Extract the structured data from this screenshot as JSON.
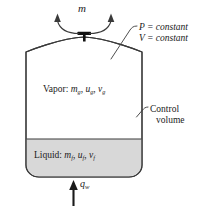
{
  "figure": {
    "colors": {
      "stroke": "#3a3a3a",
      "liquid_fill": "#d8d8d8",
      "vapor_fill": "#ffffff",
      "text": "#1a1a1a",
      "valve": "#111111"
    }
  },
  "labels": {
    "mass_flow": {
      "symbol": "m",
      "accent": "dot",
      "name": "mass flow rate out"
    },
    "pressure_constant": "P = constant",
    "volume_constant": "V = constant",
    "vapor": {
      "prefix": "Vapor:",
      "mass": "m",
      "internal_energy": "u",
      "specific_volume": "v",
      "subscript": "g"
    },
    "liquid": {
      "prefix": "Liquid:",
      "mass": "m",
      "internal_energy": "u",
      "specific_volume": "v",
      "subscript": "f"
    },
    "control_volume_line1": "Control",
    "control_volume_line2": "volume",
    "heat_flux": {
      "symbol": "q",
      "subscript": "w",
      "name": "wall heat flux in"
    }
  },
  "icons": {
    "valve": "valve-icon",
    "outflow_arrow_left": "curved-arrow-up-left-icon",
    "outflow_arrow_right": "curved-arrow-up-right-icon",
    "heat_arrow": "arrow-up-icon",
    "leader_pv": "leader-line-icon",
    "leader_cv": "leader-line-icon"
  }
}
